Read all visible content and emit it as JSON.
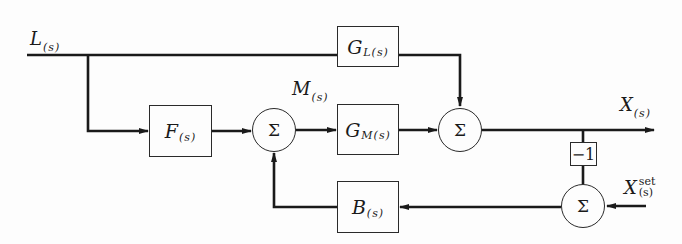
{
  "diagram": {
    "type": "block-diagram",
    "signals": {
      "disturbance": {
        "symbol": "L",
        "arg": "(s)"
      },
      "manipulated": {
        "symbol": "M",
        "arg": "(s)"
      },
      "output": {
        "symbol": "X",
        "arg": "(s)"
      },
      "setpoint": {
        "symbol": "X",
        "sup": "set",
        "arg": "(s)"
      }
    },
    "blocks": {
      "load": {
        "symbol": "G",
        "sub": "L(s)"
      },
      "feedforward": {
        "symbol": "F",
        "sub": "(s)"
      },
      "process": {
        "symbol": "G",
        "sub": "M(s)"
      },
      "feedback": {
        "symbol": "B",
        "sub": "(s)"
      },
      "negation": {
        "label": "−1"
      }
    },
    "summers": {
      "sum1": {
        "label": "Σ"
      },
      "sum2": {
        "label": "Σ"
      },
      "sum3": {
        "label": "Σ"
      }
    },
    "colors": {
      "line": "#1a1a1a",
      "background": "#fdfdfd"
    }
  }
}
